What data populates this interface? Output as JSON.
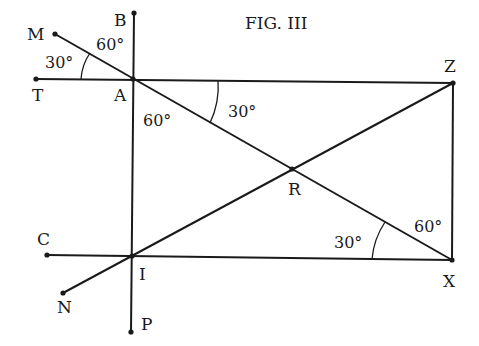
{
  "figure": {
    "title": "FIG. III",
    "points": {
      "M": "M",
      "B": "B",
      "T": "T",
      "A": "A",
      "Z": "Z",
      "R": "R",
      "C": "C",
      "I": "I",
      "X": "X",
      "N": "N",
      "P": "P"
    },
    "angles": {
      "at_A_TM": "30°",
      "at_A_MB": "60°",
      "at_A_lower": "60°",
      "at_A_right": "30°",
      "at_X_left": "30°",
      "at_X_upper": "60°"
    }
  },
  "colors": {
    "ink": "#1a1a1a",
    "background": "#ffffff"
  }
}
